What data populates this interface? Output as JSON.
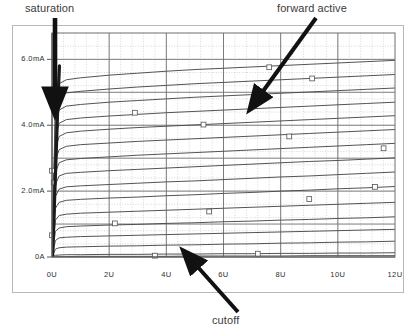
{
  "figure": {
    "kind": "transistor-output-characteristics",
    "annotations": [
      {
        "name": "saturation",
        "label": "saturation"
      },
      {
        "name": "forward-active",
        "label": "forward active"
      },
      {
        "name": "cutoff",
        "label": "cutoff"
      }
    ]
  },
  "chart_data": {
    "type": "line",
    "title": "",
    "xlabel": "",
    "ylabel": "",
    "xlim": [
      0,
      12
    ],
    "ylim": [
      0,
      6.8
    ],
    "grid": true,
    "legend": null,
    "x_unit": "U",
    "y_unit": "mA",
    "xticks": [
      0,
      2,
      4,
      6,
      8,
      10,
      12
    ],
    "xticklabels": [
      "0U",
      "2U",
      "4U",
      "6U",
      "8U",
      "10U",
      "12U"
    ],
    "yticks": [
      0,
      2,
      4,
      6
    ],
    "yticklabels": [
      "0A",
      "2.0mA",
      "4.0mA",
      "6.0mA"
    ],
    "x": [
      0,
      0.12,
      0.25,
      0.5,
      1,
      2,
      3,
      4,
      5,
      6,
      7,
      8,
      9,
      10,
      11,
      12
    ],
    "series": [
      {
        "name": "curve-1",
        "marker_x": 7.6,
        "marker_y": 5.76,
        "values": [
          0.0,
          4.72,
          5.26,
          5.38,
          5.44,
          5.52,
          5.58,
          5.64,
          5.69,
          5.73,
          5.77,
          5.81,
          5.85,
          5.89,
          5.93,
          5.97
        ]
      },
      {
        "name": "curve-2",
        "marker_x": 9.1,
        "marker_y": 5.42,
        "values": [
          0.0,
          4.36,
          4.86,
          4.98,
          5.03,
          5.1,
          5.16,
          5.21,
          5.26,
          5.3,
          5.34,
          5.38,
          5.42,
          5.46,
          5.5,
          5.54
        ]
      },
      {
        "name": "curve-3",
        "marker_x": 0.18,
        "marker_y": 4.76,
        "values": [
          0.0,
          4.0,
          4.46,
          4.58,
          4.63,
          4.7,
          4.75,
          4.8,
          4.85,
          4.89,
          4.93,
          4.97,
          5.01,
          5.05,
          5.09,
          5.13
        ]
      },
      {
        "name": "curve-4",
        "marker_x": 2.9,
        "marker_y": 4.38,
        "values": [
          0.0,
          3.64,
          4.06,
          4.17,
          4.22,
          4.28,
          4.33,
          4.38,
          4.42,
          4.46,
          4.5,
          4.54,
          4.58,
          4.62,
          4.66,
          4.7
        ]
      },
      {
        "name": "curve-5",
        "marker_x": 5.3,
        "marker_y": 4.02,
        "values": [
          0.0,
          3.28,
          3.66,
          3.77,
          3.82,
          3.88,
          3.93,
          3.97,
          4.01,
          4.05,
          4.09,
          4.13,
          4.17,
          4.21,
          4.25,
          4.29
        ]
      },
      {
        "name": "curve-6",
        "marker_x": 8.3,
        "marker_y": 3.66,
        "values": [
          0.0,
          2.92,
          3.26,
          3.36,
          3.41,
          3.46,
          3.51,
          3.55,
          3.59,
          3.63,
          3.67,
          3.71,
          3.75,
          3.79,
          3.83,
          3.87
        ]
      },
      {
        "name": "curve-7",
        "marker_x": 11.6,
        "marker_y": 3.3,
        "values": [
          0.0,
          2.56,
          2.86,
          2.95,
          2.99,
          3.04,
          3.09,
          3.13,
          3.17,
          3.21,
          3.25,
          3.29,
          3.33,
          3.37,
          3.41,
          3.45
        ]
      },
      {
        "name": "curve-8",
        "marker_x": 0.0,
        "marker_y": 2.62,
        "values": [
          0.0,
          2.2,
          2.46,
          2.54,
          2.57,
          2.62,
          2.66,
          2.7,
          2.74,
          2.78,
          2.82,
          2.86,
          2.9,
          2.93,
          2.97,
          3.01
        ]
      },
      {
        "name": "curve-9",
        "marker_x": 0.06,
        "marker_y": 2.26,
        "values": [
          0.0,
          1.84,
          2.06,
          2.13,
          2.16,
          2.2,
          2.24,
          2.28,
          2.31,
          2.35,
          2.39,
          2.43,
          2.46,
          2.5,
          2.54,
          2.58
        ]
      },
      {
        "name": "curve-10",
        "marker_x": 11.3,
        "marker_y": 2.13,
        "values": [
          0.0,
          1.48,
          1.66,
          1.72,
          1.75,
          1.79,
          1.82,
          1.86,
          1.89,
          1.93,
          1.96,
          2.0,
          2.03,
          2.07,
          2.1,
          2.14
        ]
      },
      {
        "name": "curve-11",
        "marker_x": 9.0,
        "marker_y": 1.76,
        "values": [
          0.0,
          1.12,
          1.26,
          1.3,
          1.33,
          1.36,
          1.39,
          1.42,
          1.45,
          1.48,
          1.51,
          1.54,
          1.57,
          1.6,
          1.63,
          1.66
        ]
      },
      {
        "name": "curve-12",
        "marker_x": 5.5,
        "marker_y": 1.38,
        "values": [
          0.0,
          0.78,
          0.88,
          0.92,
          0.94,
          0.97,
          0.99,
          1.02,
          1.04,
          1.07,
          1.09,
          1.12,
          1.14,
          1.17,
          1.19,
          1.22
        ]
      },
      {
        "name": "curve-13",
        "marker_x": 2.2,
        "marker_y": 1.02,
        "values": [
          0.0,
          0.5,
          0.58,
          0.6,
          0.62,
          0.64,
          0.66,
          0.68,
          0.7,
          0.72,
          0.74,
          0.76,
          0.78,
          0.8,
          0.82,
          0.84
        ]
      },
      {
        "name": "curve-14",
        "marker_x": 0.0,
        "marker_y": 0.66,
        "values": [
          0.0,
          0.24,
          0.28,
          0.3,
          0.31,
          0.33,
          0.34,
          0.36,
          0.37,
          0.39,
          0.4,
          0.42,
          0.43,
          0.45,
          0.46,
          0.48
        ]
      },
      {
        "name": "curve-15",
        "marker_x": 7.2,
        "marker_y": 0.1,
        "values": [
          0.0,
          0.05,
          0.06,
          0.07,
          0.07,
          0.08,
          0.08,
          0.09,
          0.09,
          0.1,
          0.1,
          0.11,
          0.11,
          0.12,
          0.12,
          0.13
        ]
      },
      {
        "name": "curve-16",
        "marker_x": 3.6,
        "marker_y": 0.04,
        "values": [
          0.0,
          0.01,
          0.01,
          0.01,
          0.02,
          0.02,
          0.02,
          0.02,
          0.03,
          0.03,
          0.03,
          0.03,
          0.04,
          0.04,
          0.04,
          0.04
        ]
      }
    ],
    "saturation_boundary": {
      "name": "saturation-locus",
      "x": [
        0.02,
        0.06,
        0.1,
        0.14,
        0.18,
        0.22,
        0.26
      ],
      "y": [
        0.0,
        1.0,
        2.0,
        3.0,
        4.0,
        5.0,
        5.8
      ]
    }
  },
  "colors": {
    "frame": "#b8b8b8",
    "grid_major": "#6e6e6e",
    "grid_minor": "#c9b9b9",
    "curve": "#4a4a4a",
    "axis": "#555555",
    "text": "#3b3b3b",
    "arrow": "#111111",
    "marker_stroke": "#555555",
    "background": "#ffffff"
  }
}
